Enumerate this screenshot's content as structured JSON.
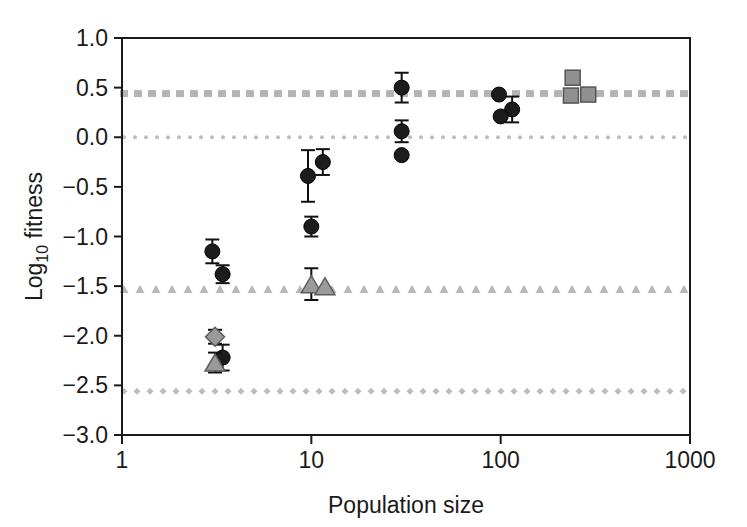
{
  "chart_data": {
    "type": "scatter",
    "title": "",
    "xlabel": "Population size",
    "ylabel_main": "Log",
    "ylabel_sub": "10",
    "ylabel_tail": " fitness",
    "ylabel_full": "Log10 fitness",
    "xscale": "log",
    "xlim": [
      1,
      1000
    ],
    "ylim": [
      -3.0,
      1.0
    ],
    "grid": false,
    "legend": "none",
    "xticks": [
      1,
      10,
      100,
      1000
    ],
    "xtick_labels": [
      "1",
      "10",
      "100",
      "1000"
    ],
    "yticks": [
      1.0,
      0.5,
      0.0,
      -0.5,
      -1.0,
      -1.5,
      -2.0,
      -2.5,
      -3.0
    ],
    "ytick_labels": [
      "1.0",
      "0.5",
      "0.0",
      "−0.5",
      "−1.0",
      "−1.5",
      "−2.0",
      "−2.5",
      "−3.0"
    ],
    "reference_lines": [
      {
        "name": "square-dashed-reference",
        "y": 0.44,
        "marker": "square",
        "color": "#b4b4b4"
      },
      {
        "name": "dotted-zero-reference",
        "y": 0.0,
        "marker": "dot",
        "color": "#bdbdbd"
      },
      {
        "name": "triangle-dashed-reference",
        "y": -1.53,
        "marker": "triangle",
        "color": "#b7b7b7"
      },
      {
        "name": "diamond-dashed-reference",
        "y": -2.56,
        "marker": "diamond",
        "color": "#bdbdbd"
      }
    ],
    "series": [
      {
        "name": "circles",
        "marker": "circle",
        "color": "#1c1c1c",
        "points": [
          {
            "x": 3.0,
            "y": -1.15,
            "yerr": 0.12
          },
          {
            "x": 3.4,
            "y": -1.38,
            "yerr": 0.09
          },
          {
            "x": 3.4,
            "y": -2.22,
            "yerr": 0.13
          },
          {
            "x": 9.6,
            "y": -0.39,
            "yerr": 0.26
          },
          {
            "x": 11.5,
            "y": -0.25,
            "yerr": 0.13
          },
          {
            "x": 10.0,
            "y": -0.9,
            "yerr": 0.1
          },
          {
            "x": 30.0,
            "y": 0.5,
            "yerr": 0.15
          },
          {
            "x": 30.0,
            "y": 0.06,
            "yerr": 0.11
          },
          {
            "x": 30.0,
            "y": -0.18,
            "yerr": 0.0
          },
          {
            "x": 98.0,
            "y": 0.43,
            "yerr": 0.0
          },
          {
            "x": 115.0,
            "y": 0.28,
            "yerr": 0.13
          },
          {
            "x": 100.0,
            "y": 0.21,
            "yerr": 0.0
          }
        ]
      },
      {
        "name": "triangles",
        "marker": "triangle",
        "color": "#9a9a9a",
        "points": [
          {
            "x": 3.1,
            "y": -2.27,
            "yerr": 0.1
          },
          {
            "x": 10.0,
            "y": -1.48,
            "yerr": 0.16
          },
          {
            "x": 11.8,
            "y": -1.5,
            "yerr": 0.0
          }
        ]
      },
      {
        "name": "diamonds",
        "marker": "diamond",
        "color": "#9a9a9a",
        "points": [
          {
            "x": 3.1,
            "y": -2.01,
            "yerr": 0.07
          }
        ]
      },
      {
        "name": "squares",
        "marker": "square",
        "color": "#909090",
        "points": [
          {
            "x": 240.0,
            "y": 0.6,
            "yerr": 0.06
          },
          {
            "x": 235.0,
            "y": 0.42,
            "yerr": 0.06
          },
          {
            "x": 290.0,
            "y": 0.43,
            "yerr": 0.06
          }
        ]
      }
    ]
  }
}
